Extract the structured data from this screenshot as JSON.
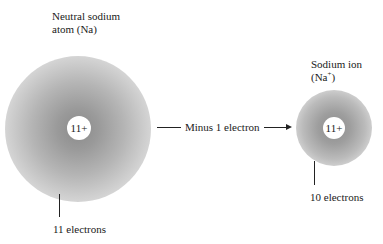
{
  "diagram": {
    "neutral_atom": {
      "title_line1": "Neutral sodium",
      "title_line2": "atom (Na)",
      "nucleus_charge": "11+",
      "electron_label": "11 electrons"
    },
    "transition": {
      "label": "Minus 1 electron"
    },
    "ion": {
      "title_line1": "Sodium ion",
      "title_prefix": "(Na",
      "title_sup": "+",
      "title_suffix": ")",
      "nucleus_charge": "11+",
      "electron_label": "10 electrons"
    },
    "colors": {
      "cloud_core": "#8a8a8a",
      "nucleus": "#ffffff",
      "text": "#1a1a1a"
    }
  }
}
